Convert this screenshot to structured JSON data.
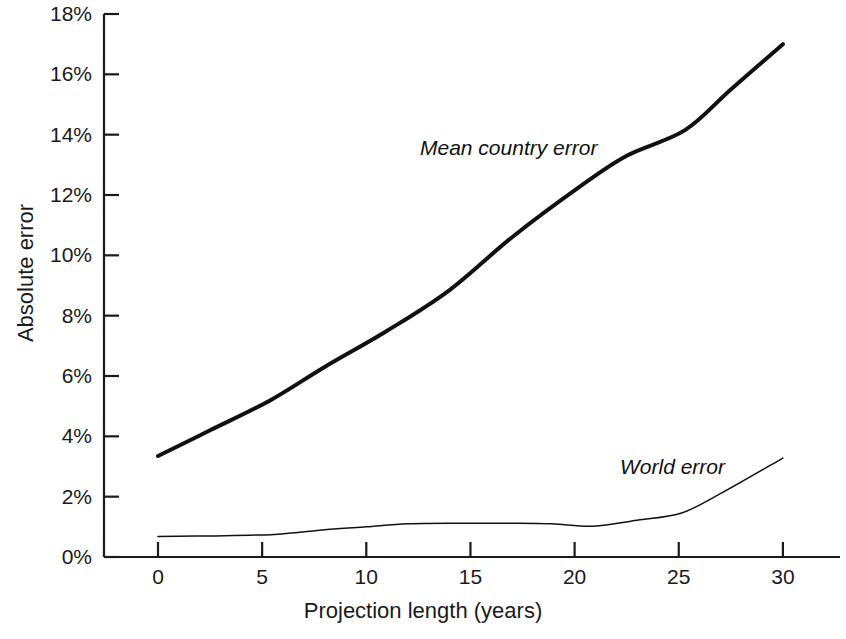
{
  "figure": {
    "width": 846,
    "height": 639,
    "background": "#ffffff",
    "line_color": "#111111"
  },
  "axes": {
    "x_label": "Projection length (years)",
    "y_label": "Absolute error",
    "x_ticks": [
      "0",
      "5",
      "10",
      "15",
      "20",
      "25",
      "30"
    ],
    "y_ticks": [
      "0%",
      "2%",
      "4%",
      "6%",
      "8%",
      "10%",
      "12%",
      "14%",
      "16%",
      "18%"
    ],
    "x_range": [
      0,
      33
    ],
    "y_range": [
      0,
      18
    ],
    "grid": "off"
  },
  "annotations": {
    "mean_country_error": "Mean country error",
    "world_error": "World error"
  },
  "chart_data": {
    "type": "line",
    "title": "",
    "xlabel": "Projection length (years)",
    "ylabel": "Absolute error",
    "xlim": [
      0,
      33
    ],
    "ylim": [
      0,
      18
    ],
    "x_tick_values": [
      0,
      5,
      10,
      15,
      20,
      25,
      30
    ],
    "y_tick_values": [
      0,
      2,
      4,
      6,
      8,
      10,
      12,
      14,
      16,
      18
    ],
    "y_tick_labels": [
      "0%",
      "2%",
      "4%",
      "6%",
      "8%",
      "10%",
      "12%",
      "14%",
      "16%",
      "18%"
    ],
    "grid": false,
    "legend": "inline-annotations",
    "series": [
      {
        "name": "Mean country error",
        "label_position": {
          "x": 12.6,
          "y": 13.2
        },
        "line_width": 4,
        "x": [
          0,
          2.5,
          5.4,
          8,
          11,
          14,
          17,
          20.2,
          22.5,
          25.3,
          27.5,
          30
        ],
        "y": [
          3.35,
          4.2,
          5.2,
          6.3,
          7.5,
          8.85,
          10.6,
          12.25,
          13.3,
          14.15,
          15.5,
          17.0
        ]
      },
      {
        "name": "World error",
        "label_position": {
          "x": 22.2,
          "y": 3.1
        },
        "line_width": 1.5,
        "x": [
          0,
          2.5,
          5.6,
          8,
          10,
          12,
          14.5,
          17,
          18.9,
          20.9,
          23,
          25.1,
          27,
          30
        ],
        "y": [
          0.68,
          0.7,
          0.75,
          0.9,
          1.0,
          1.1,
          1.12,
          1.12,
          1.1,
          1.02,
          1.22,
          1.45,
          2.1,
          3.28
        ]
      }
    ]
  }
}
